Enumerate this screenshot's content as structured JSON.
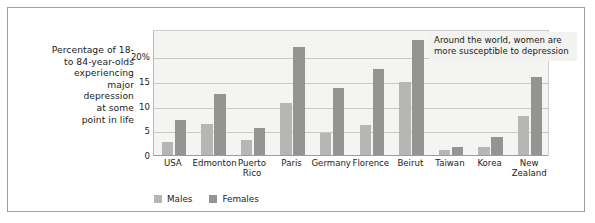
{
  "caption": "Percentage of 18-\nto 84-year-olds\nexperiencing\nmajor\ndepression\nat some\npoint in life",
  "caption_lines": [
    "Percentage of 18-",
    "to 84-year-olds",
    "experiencing",
    "major",
    "depression",
    "at some",
    "point in life"
  ],
  "annotation": {
    "text": "Around the world, women are more susceptible to depression"
  },
  "legend": {
    "position": "bottom-left",
    "items": [
      {
        "label": "Males",
        "color": "#b6b6b4"
      },
      {
        "label": "Females",
        "color": "#949492"
      }
    ]
  },
  "colors": {
    "males": "#b6b6b4",
    "females": "#949492",
    "plot_background": "#f4f4f2",
    "gridline": "#c9c9c4",
    "frame_border": "#9aa39a",
    "annotation_background": "#f2f2f0",
    "text": "#1c1c1c"
  },
  "chart_data": {
    "type": "bar",
    "title": "",
    "subtitle": "",
    "xlabel": "",
    "ylabel": "Percentage of 18- to 84-year-olds experiencing major depression at some point in life",
    "ylim": [
      0,
      25.5
    ],
    "yticks": [
      0,
      5,
      10,
      15,
      20
    ],
    "ytick_labels": [
      "0",
      "5",
      "10",
      "15",
      "20%"
    ],
    "grid": true,
    "grid_axis": "y",
    "legend_position": "bottom-left",
    "categories": [
      "USA",
      "Edmonton",
      "Puerto Rico",
      "Paris",
      "Germany",
      "Florence",
      "Beirut",
      "Taiwan",
      "Korea",
      "New Zealand"
    ],
    "category_label_lines": [
      [
        "USA"
      ],
      [
        "Edmonton"
      ],
      [
        "Puerto",
        "Rico"
      ],
      [
        "Paris"
      ],
      [
        "Germany"
      ],
      [
        "Florence"
      ],
      [
        "Beirut"
      ],
      [
        "Taiwan"
      ],
      [
        "Korea"
      ],
      [
        "New",
        "Zealand"
      ]
    ],
    "series": [
      {
        "name": "Males",
        "color": "#b6b6b4",
        "values": [
          2.8,
          6.5,
          3.2,
          10.7,
          4.7,
          6.3,
          15.0,
          1.3,
          1.8,
          8.0
        ]
      },
      {
        "name": "Females",
        "color": "#949492",
        "values": [
          7.3,
          12.5,
          5.6,
          22.0,
          13.8,
          17.7,
          23.5,
          1.8,
          3.8,
          16.0
        ]
      }
    ],
    "annotations": [
      {
        "text": "Around the world, women are more susceptible to depression",
        "anchor": "top-right"
      }
    ]
  }
}
